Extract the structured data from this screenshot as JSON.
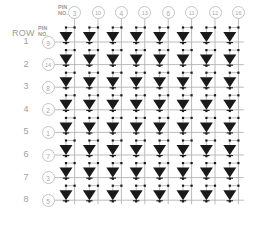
{
  "diagram": {
    "row_header_label": "ROW",
    "pin_header_label_line1": "PIN",
    "pin_header_label_line2": "NO.",
    "col_pin_header_line1": "PIN",
    "col_pin_header_line2": "NO.",
    "grid_rows": 8,
    "grid_cols": 8,
    "line_color": "#b3b3b3",
    "led_color": "#1a1a1a",
    "node_color": "#1a1a1a",
    "text_color": "#9b9b9b",
    "circle_stroke": "#c4c4c4",
    "background": "#ffffff",
    "led_symbol_name": "led-diode-triangle-down",
    "rows": [
      {
        "row_label": "1",
        "pin_no": "9"
      },
      {
        "row_label": "2",
        "pin_no": "14"
      },
      {
        "row_label": "3",
        "pin_no": "8"
      },
      {
        "row_label": "4",
        "pin_no": "2"
      },
      {
        "row_label": "5",
        "pin_no": "1"
      },
      {
        "row_label": "6",
        "pin_no": "7"
      },
      {
        "row_label": "7",
        "pin_no": "3"
      },
      {
        "row_label": "8",
        "pin_no": "5"
      }
    ],
    "columns": [
      {
        "col_index": "1",
        "pin_no": "3"
      },
      {
        "col_index": "2",
        "pin_no": "10"
      },
      {
        "col_index": "3",
        "pin_no": "4"
      },
      {
        "col_index": "4",
        "pin_no": "13"
      },
      {
        "col_index": "5",
        "pin_no": "6"
      },
      {
        "col_index": "6",
        "pin_no": "11"
      },
      {
        "col_index": "7",
        "pin_no": "12"
      },
      {
        "col_index": "8",
        "pin_no": "16"
      }
    ]
  }
}
